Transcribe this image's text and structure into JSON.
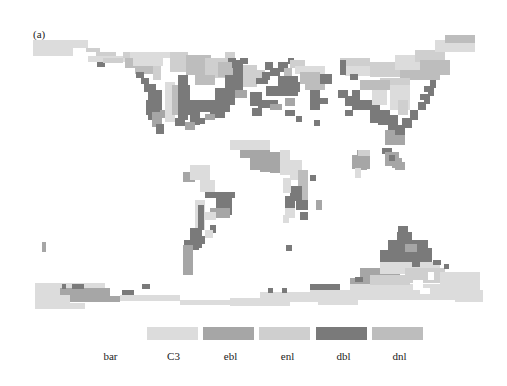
{
  "figure": {
    "panel_label": "(a)"
  },
  "palette": {
    "bar": "#ffffff",
    "C3": "#dcdcdc",
    "ebl": "#a6a6a6",
    "enl": "#cfcfcf",
    "dbl": "#7a7a7a",
    "dnl": "#bdbdbd"
  },
  "legend": {
    "items": [
      {
        "key": "bar",
        "label": "bar",
        "color": "#ffffff",
        "x": 97,
        "w": 41,
        "label_x": 90
      },
      {
        "key": "C3",
        "label": "C3",
        "color": "#dcdcdc",
        "x": 147,
        "w": 51,
        "label_x": 148
      },
      {
        "key": "ebl",
        "label": "ebl",
        "color": "#a6a6a6",
        "x": 203,
        "w": 51,
        "label_x": 205
      },
      {
        "key": "enl",
        "label": "enl",
        "color": "#cfcfcf",
        "x": 259,
        "w": 51,
        "label_x": 262
      },
      {
        "key": "dbl",
        "label": "dbl",
        "color": "#7a7a7a",
        "x": 316,
        "w": 51,
        "label_x": 318
      },
      {
        "key": "dnl",
        "label": "dnl",
        "color": "#bdbdbd",
        "x": 372,
        "w": 51,
        "label_x": 374
      }
    ]
  },
  "map": {
    "description": "Global vegetation type map on coarse grid",
    "cells": [
      [
        33,
        40,
        55,
        8,
        "C3"
      ],
      [
        33,
        48,
        40,
        8,
        "C3"
      ],
      [
        86,
        48,
        14,
        4,
        "enl"
      ],
      [
        96,
        52,
        20,
        5,
        "enl"
      ],
      [
        88,
        56,
        40,
        6,
        "C3"
      ],
      [
        97,
        62,
        8,
        5,
        "dbl"
      ],
      [
        103,
        58,
        20,
        5,
        "enl"
      ],
      [
        123,
        52,
        35,
        6,
        "enl"
      ],
      [
        125,
        58,
        30,
        10,
        "dnl"
      ],
      [
        135,
        66,
        20,
        8,
        "dnl"
      ],
      [
        153,
        60,
        8,
        20,
        "enl"
      ],
      [
        136,
        72,
        8,
        6,
        "dbl"
      ],
      [
        141,
        78,
        8,
        6,
        "dbl"
      ],
      [
        144,
        84,
        12,
        8,
        "dbl"
      ],
      [
        148,
        90,
        14,
        30,
        "dbl"
      ],
      [
        146,
        100,
        6,
        15,
        "dbl"
      ],
      [
        152,
        112,
        10,
        15,
        "ebl"
      ],
      [
        156,
        124,
        8,
        10,
        "dbl"
      ],
      [
        160,
        110,
        6,
        8,
        "ebl"
      ],
      [
        165,
        82,
        10,
        40,
        "C3"
      ],
      [
        172,
        85,
        12,
        30,
        "dnl"
      ],
      [
        178,
        100,
        10,
        20,
        "dbl"
      ],
      [
        175,
        118,
        8,
        6,
        "dbl"
      ],
      [
        130,
        52,
        40,
        6,
        "C3"
      ],
      [
        133,
        58,
        30,
        8,
        "C3"
      ],
      [
        170,
        52,
        18,
        20,
        "enl"
      ],
      [
        186,
        55,
        25,
        20,
        "dnl"
      ],
      [
        205,
        58,
        22,
        20,
        "enl"
      ],
      [
        225,
        52,
        10,
        10,
        "enl"
      ],
      [
        228,
        58,
        8,
        5,
        "dbl"
      ],
      [
        218,
        62,
        15,
        15,
        "dnl"
      ],
      [
        195,
        75,
        20,
        10,
        "dnl"
      ],
      [
        178,
        75,
        10,
        40,
        "dbl"
      ],
      [
        184,
        85,
        6,
        30,
        "dbl"
      ],
      [
        190,
        100,
        10,
        25,
        "dbl"
      ],
      [
        200,
        100,
        30,
        12,
        "dbl"
      ],
      [
        215,
        88,
        12,
        20,
        "dbl"
      ],
      [
        225,
        75,
        10,
        30,
        "dbl"
      ],
      [
        232,
        62,
        6,
        6,
        "dbl"
      ],
      [
        210,
        110,
        15,
        8,
        "dbl"
      ],
      [
        175,
        120,
        10,
        6,
        "dbl"
      ],
      [
        185,
        122,
        10,
        8,
        "ebl"
      ],
      [
        195,
        118,
        10,
        6,
        "dbl"
      ],
      [
        205,
        114,
        10,
        6,
        "ebl"
      ],
      [
        235,
        90,
        12,
        8,
        "ebl"
      ],
      [
        233,
        60,
        10,
        30,
        "dbl"
      ],
      [
        240,
        58,
        8,
        6,
        "dbl"
      ],
      [
        243,
        65,
        14,
        22,
        "enl"
      ],
      [
        255,
        70,
        10,
        10,
        "enl"
      ],
      [
        265,
        62,
        8,
        8,
        "dbl"
      ],
      [
        270,
        68,
        10,
        8,
        "dbl"
      ],
      [
        256,
        78,
        12,
        6,
        "dbl"
      ],
      [
        262,
        72,
        8,
        8,
        "dbl"
      ],
      [
        278,
        62,
        10,
        10,
        "dbl"
      ],
      [
        284,
        68,
        8,
        8,
        "dnl"
      ],
      [
        288,
        58,
        6,
        6,
        "dbl"
      ],
      [
        278,
        76,
        20,
        20,
        "dbl"
      ],
      [
        266,
        86,
        14,
        10,
        "dbl"
      ],
      [
        250,
        92,
        12,
        14,
        "dbl"
      ],
      [
        258,
        100,
        20,
        8,
        "dbl"
      ],
      [
        270,
        104,
        12,
        6,
        "ebl"
      ],
      [
        252,
        108,
        10,
        8,
        "dbl"
      ],
      [
        285,
        98,
        10,
        8,
        "ebl"
      ],
      [
        290,
        60,
        15,
        8,
        "enl"
      ],
      [
        295,
        66,
        30,
        8,
        "C3"
      ],
      [
        300,
        72,
        20,
        12,
        "dnl"
      ],
      [
        305,
        80,
        20,
        10,
        "dnl"
      ],
      [
        285,
        82,
        15,
        10,
        "dbl"
      ],
      [
        310,
        90,
        10,
        20,
        "dbl"
      ],
      [
        320,
        74,
        12,
        10,
        "dbl"
      ],
      [
        318,
        98,
        10,
        6,
        "dbl"
      ],
      [
        285,
        110,
        10,
        6,
        "dbl"
      ],
      [
        314,
        120,
        6,
        6,
        "dbl"
      ],
      [
        296,
        116,
        6,
        6,
        "dbl"
      ],
      [
        340,
        58,
        30,
        10,
        "enl"
      ],
      [
        345,
        66,
        30,
        10,
        "C3"
      ],
      [
        370,
        62,
        30,
        15,
        "enl"
      ],
      [
        395,
        55,
        30,
        15,
        "C3"
      ],
      [
        415,
        50,
        30,
        12,
        "enl"
      ],
      [
        435,
        40,
        40,
        12,
        "C3"
      ],
      [
        445,
        35,
        30,
        8,
        "dnl"
      ],
      [
        420,
        60,
        30,
        15,
        "dnl"
      ],
      [
        400,
        70,
        40,
        10,
        "dnl"
      ],
      [
        380,
        78,
        30,
        10,
        "enl"
      ],
      [
        360,
        80,
        30,
        10,
        "dnl"
      ],
      [
        340,
        60,
        6,
        15,
        "dbl"
      ],
      [
        338,
        90,
        10,
        8,
        "dbl"
      ],
      [
        345,
        96,
        10,
        10,
        "dbl"
      ],
      [
        352,
        90,
        8,
        20,
        "dbl"
      ],
      [
        360,
        100,
        15,
        10,
        "dbl"
      ],
      [
        370,
        105,
        10,
        18,
        "dbl"
      ],
      [
        378,
        110,
        12,
        15,
        "dbl"
      ],
      [
        388,
        115,
        10,
        20,
        "dbl"
      ],
      [
        385,
        130,
        20,
        15,
        "ebl"
      ],
      [
        395,
        125,
        10,
        10,
        "dbl"
      ],
      [
        402,
        118,
        10,
        10,
        "dbl"
      ],
      [
        410,
        110,
        8,
        10,
        "dbl"
      ],
      [
        418,
        102,
        8,
        8,
        "dbl"
      ],
      [
        424,
        96,
        6,
        8,
        "dbl"
      ],
      [
        428,
        88,
        6,
        8,
        "dbl"
      ],
      [
        430,
        80,
        6,
        8,
        "dbl"
      ],
      [
        420,
        94,
        8,
        6,
        "dbl"
      ],
      [
        424,
        86,
        6,
        6,
        "dbl"
      ],
      [
        390,
        85,
        20,
        25,
        "C3"
      ],
      [
        398,
        100,
        10,
        15,
        "enl"
      ],
      [
        372,
        90,
        15,
        15,
        "C3"
      ],
      [
        345,
        110,
        8,
        6,
        "dbl"
      ],
      [
        350,
        74,
        8,
        6,
        "dbl"
      ],
      [
        357,
        150,
        10,
        20,
        "ebl"
      ],
      [
        352,
        155,
        18,
        14,
        "ebl"
      ],
      [
        358,
        150,
        12,
        6,
        "enl"
      ],
      [
        355,
        168,
        6,
        10,
        "C3"
      ],
      [
        382,
        148,
        10,
        6,
        "dbl"
      ],
      [
        385,
        152,
        14,
        14,
        "ebl"
      ],
      [
        392,
        158,
        10,
        10,
        "ebl"
      ],
      [
        395,
        162,
        10,
        8,
        "ebl"
      ],
      [
        389,
        155,
        6,
        6,
        "dbl"
      ],
      [
        230,
        140,
        40,
        10,
        "C3"
      ],
      [
        240,
        150,
        30,
        8,
        "ebl"
      ],
      [
        250,
        150,
        20,
        20,
        "ebl"
      ],
      [
        260,
        152,
        20,
        20,
        "ebl"
      ],
      [
        270,
        158,
        14,
        15,
        "ebl"
      ],
      [
        280,
        150,
        10,
        25,
        "C3"
      ],
      [
        290,
        160,
        12,
        20,
        "C3"
      ],
      [
        298,
        170,
        10,
        30,
        "dnl"
      ],
      [
        290,
        186,
        12,
        15,
        "dbl"
      ],
      [
        296,
        200,
        12,
        10,
        "dbl"
      ],
      [
        285,
        196,
        10,
        15,
        "dbl"
      ],
      [
        300,
        212,
        8,
        8,
        "dbl"
      ],
      [
        285,
        208,
        10,
        10,
        "C3"
      ],
      [
        283,
        215,
        6,
        8,
        "C3"
      ],
      [
        310,
        175,
        6,
        6,
        "dbl"
      ],
      [
        316,
        200,
        6,
        10,
        "ebl"
      ],
      [
        283,
        178,
        8,
        15,
        "C3"
      ],
      [
        286,
        245,
        6,
        6,
        "dbl"
      ],
      [
        183,
        172,
        12,
        10,
        "ebl"
      ],
      [
        190,
        165,
        20,
        15,
        "C3"
      ],
      [
        200,
        180,
        15,
        12,
        "C3"
      ],
      [
        205,
        192,
        30,
        6,
        "dbl"
      ],
      [
        216,
        195,
        16,
        20,
        "dbl"
      ],
      [
        210,
        208,
        20,
        10,
        "ebl"
      ],
      [
        204,
        212,
        12,
        8,
        "C3"
      ],
      [
        210,
        225,
        6,
        8,
        "dbl"
      ],
      [
        195,
        200,
        10,
        30,
        "C3"
      ],
      [
        198,
        205,
        6,
        25,
        "dbl"
      ],
      [
        190,
        228,
        12,
        20,
        "dbl"
      ],
      [
        184,
        240,
        15,
        10,
        "dbl"
      ],
      [
        183,
        245,
        10,
        30,
        "ebl"
      ],
      [
        195,
        236,
        10,
        8,
        "dbl"
      ],
      [
        205,
        230,
        8,
        8,
        "C3"
      ],
      [
        397,
        232,
        15,
        20,
        "dbl"
      ],
      [
        388,
        240,
        40,
        25,
        "dbl"
      ],
      [
        398,
        226,
        10,
        8,
        "dbl"
      ],
      [
        380,
        250,
        8,
        15,
        "dbl"
      ],
      [
        420,
        248,
        12,
        18,
        "dbl"
      ],
      [
        405,
        244,
        12,
        8,
        "ebl"
      ],
      [
        405,
        262,
        10,
        10,
        "C3"
      ],
      [
        425,
        262,
        8,
        6,
        "ebl"
      ],
      [
        42,
        242,
        4,
        10,
        "ebl"
      ],
      [
        35,
        283,
        70,
        12,
        "C3"
      ],
      [
        60,
        288,
        50,
        8,
        "ebl"
      ],
      [
        60,
        296,
        60,
        6,
        "ebl"
      ],
      [
        35,
        295,
        35,
        8,
        "C3"
      ],
      [
        35,
        303,
        50,
        6,
        "C3"
      ],
      [
        120,
        295,
        60,
        6,
        "C3"
      ],
      [
        180,
        300,
        40,
        5,
        "C3"
      ],
      [
        62,
        284,
        4,
        5,
        "dbl"
      ],
      [
        72,
        284,
        12,
        5,
        "dbl"
      ],
      [
        122,
        290,
        12,
        5,
        "dbl"
      ],
      [
        142,
        284,
        8,
        5,
        "dbl"
      ],
      [
        195,
        300,
        40,
        5,
        "C3"
      ],
      [
        230,
        298,
        60,
        8,
        "C3"
      ],
      [
        260,
        292,
        80,
        10,
        "C3"
      ],
      [
        268,
        288,
        5,
        5,
        "dbl"
      ],
      [
        282,
        288,
        5,
        5,
        "dbl"
      ],
      [
        310,
        290,
        60,
        10,
        "C3"
      ],
      [
        310,
        284,
        30,
        6,
        "dbl"
      ],
      [
        350,
        278,
        30,
        10,
        "ebl"
      ],
      [
        350,
        284,
        130,
        16,
        "C3"
      ],
      [
        360,
        268,
        40,
        14,
        "ebl"
      ],
      [
        380,
        262,
        60,
        12,
        "C3"
      ],
      [
        370,
        275,
        40,
        10,
        "enl"
      ],
      [
        405,
        268,
        40,
        15,
        "enl"
      ],
      [
        412,
        262,
        8,
        5,
        "dbl"
      ],
      [
        433,
        260,
        8,
        5,
        "dbl"
      ],
      [
        444,
        264,
        5,
        5,
        "dbl"
      ],
      [
        355,
        277,
        8,
        5,
        "dbl"
      ],
      [
        440,
        272,
        40,
        25,
        "C3"
      ],
      [
        455,
        290,
        28,
        12,
        "C3"
      ],
      [
        318,
        300,
        40,
        5,
        "C3"
      ]
    ],
    "holes": [
      [
        413,
        280,
        10,
        10
      ],
      [
        428,
        272,
        6,
        8
      ],
      [
        420,
        288,
        10,
        6
      ]
    ]
  }
}
